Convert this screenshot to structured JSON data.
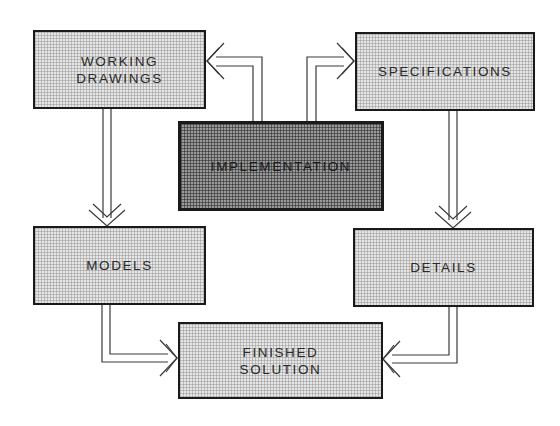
{
  "diagram": {
    "type": "flow",
    "nodes": [
      {
        "id": "working-drawings",
        "label": "WORKING\nDRAWINGS"
      },
      {
        "id": "specifications",
        "label": "SPECIFICATIONS"
      },
      {
        "id": "implementation",
        "label": "IMPLEMENTATION",
        "emphasis": "dark"
      },
      {
        "id": "models",
        "label": "MODELS"
      },
      {
        "id": "details",
        "label": "DETAILS"
      },
      {
        "id": "finished-solution",
        "label": "FINISHED\nSOLUTION"
      }
    ],
    "edges": [
      {
        "from": "implementation",
        "to": "working-drawings"
      },
      {
        "from": "implementation",
        "to": "specifications"
      },
      {
        "from": "working-drawings",
        "to": "models"
      },
      {
        "from": "specifications",
        "to": "details"
      },
      {
        "from": "models",
        "to": "finished-solution"
      },
      {
        "from": "details",
        "to": "finished-solution"
      }
    ],
    "colors": {
      "light_fill": "#e6e6e6",
      "dark_fill": "#9a9a9a",
      "border": "#1a1a1a",
      "line": "#3a3a3a"
    }
  }
}
